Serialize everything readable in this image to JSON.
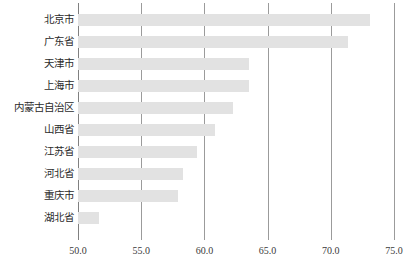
{
  "chart_data": {
    "type": "bar",
    "orientation": "horizontal",
    "title": "",
    "subtitle": "",
    "xlabel": "",
    "ylabel": "",
    "categories": [
      "北京市",
      "广东省",
      "天津市",
      "上海市",
      "内蒙古自治区",
      "山西省",
      "江苏省",
      "河北省",
      "重庆市",
      "湖北省"
    ],
    "values": [
      73.1,
      71.4,
      63.5,
      63.5,
      62.3,
      60.8,
      59.4,
      58.3,
      57.9,
      51.7
    ],
    "xlim": [
      50.0,
      75.0
    ],
    "xticks": [
      50.0,
      55.0,
      60.0,
      65.0,
      70.0,
      75.0
    ],
    "xtick_labels": [
      "50.0",
      "55.0",
      "60.0",
      "65.0",
      "70.0",
      "75.0"
    ],
    "grid": true,
    "grid_axis": "x",
    "legend": null,
    "bar_color": "#e2e2e2",
    "gridline_color": "#9b9b9b",
    "axis_color": "#808080",
    "background_color": "#ffffff",
    "label_color": "#2b2b2b"
  }
}
